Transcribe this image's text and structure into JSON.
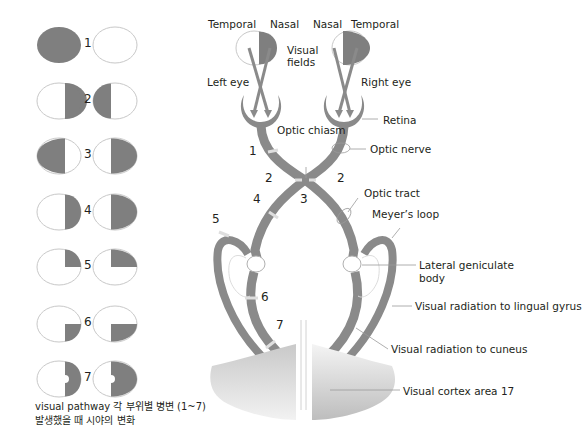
{
  "colors": {
    "deficit": "#7f7f7f",
    "field_outline": "#c8c8c8",
    "pathway": "#8a8a8a",
    "lesion_mark": "#d8d8d8",
    "text": "#231f20"
  },
  "field_defects": {
    "rows": [
      {
        "number": "1",
        "description": "Left eye blind (optic nerve)"
      },
      {
        "number": "2",
        "description": "Nasal hemianopia"
      },
      {
        "number": "3",
        "description": "Bitemporal hemianopia"
      },
      {
        "number": "4",
        "description": "Right homonymous hemianopia"
      },
      {
        "number": "5",
        "description": "Right superior quadrantanopia"
      },
      {
        "number": "6",
        "description": "Right inferior quadrantanopia"
      },
      {
        "number": "7",
        "description": "Right homonymous hemianopia with macular sparing"
      }
    ],
    "caption_line1": "visual pathway 각 부위별 병변 (1~7)",
    "caption_line2": "발생했을 때 시야의 변화"
  },
  "pathway": {
    "field_labels": {
      "left_temporal": "Temporal",
      "left_nasal": "Nasal",
      "right_nasal": "Nasal",
      "right_temporal": "Temporal",
      "visual_fields_line1": "Visual",
      "visual_fields_line2": "fields"
    },
    "eye_labels": {
      "left": "Left eye",
      "right": "Right eye"
    },
    "structures": {
      "retina": "Retina",
      "optic_chiasm": "Optic chiasm",
      "optic_nerve": "Optic nerve",
      "optic_tract": "Optic tract",
      "meyers_loop": "Meyer’s loop",
      "lgb_line1": "Lateral geniculate",
      "lgb_line2": "body",
      "radiation_lingual": "Visual radiation to lingual gyrus",
      "radiation_cuneus": "Visual radiation to cuneus",
      "visual_cortex": "Visual cortex area 17"
    },
    "lesion_numbers": {
      "n1": "1",
      "n2_left": "2",
      "n2_right": "2",
      "n3": "3",
      "n4": "4",
      "n5": "5",
      "n6": "6",
      "n7": "7"
    }
  }
}
